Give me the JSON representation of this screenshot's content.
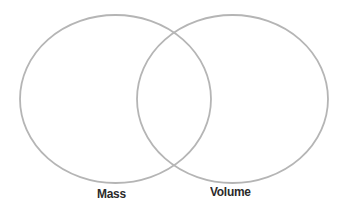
{
  "diagram": {
    "type": "venn",
    "sets": [
      {
        "id": "mass",
        "label": "Mass",
        "cx": 115.5,
        "cy": 99,
        "rx": 95.5,
        "ry": 84
      },
      {
        "id": "volume",
        "label": "Volume",
        "cx": 232.5,
        "cy": 99,
        "rx": 95.5,
        "ry": 84
      }
    ],
    "stroke_color": "#b5b5b5",
    "label_color": "#2a2a2a"
  }
}
